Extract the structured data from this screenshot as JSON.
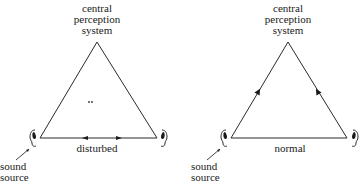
{
  "panels": [
    {
      "id": "disturbed",
      "apex_label": [
        "central",
        "perception",
        "system"
      ],
      "bottom_label": "disturbed",
      "source_label": [
        "sound",
        "source"
      ],
      "center_mark": "..",
      "arrows": "bottom edge arrows pointing toward each other"
    },
    {
      "id": "normal",
      "apex_label": [
        "central",
        "perception",
        "system"
      ],
      "bottom_label": "normal",
      "source_label": [
        "sound",
        "source"
      ],
      "arrows": "side edge arrows pointing up toward apex"
    }
  ],
  "colors": {
    "line": "#2a2a2a",
    "text": "#1a1a1a",
    "background": "#ffffff"
  }
}
